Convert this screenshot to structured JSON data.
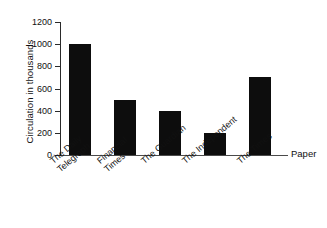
{
  "chart_data": {
    "type": "bar",
    "title": "",
    "subtitle": "",
    "xlabel": "Paper",
    "ylabel": "Circulation in thousands",
    "categories": [
      "The Daily Telegraph",
      "Financial Times",
      "The Guardian",
      "The Independent",
      "The Times"
    ],
    "category_lines": [
      [
        "The Daily",
        "Telegraph"
      ],
      [
        "Financial",
        "Times"
      ],
      [
        "The Guardian"
      ],
      [
        "The Independent"
      ],
      [
        "The Times"
      ]
    ],
    "values": [
      1000,
      500,
      400,
      200,
      700
    ],
    "ylim": [
      0,
      1200
    ],
    "yticks": [
      0,
      200,
      400,
      600,
      800,
      1000,
      1200
    ],
    "ytick_labels": [
      "0",
      "200",
      "400",
      "600",
      "800",
      "1000",
      "1200"
    ],
    "grid": false,
    "legend": false,
    "legend_position": "none",
    "bar_color": "#0d0d0d",
    "background_color": "#ffffff",
    "axis_color": "#2a2a2a"
  },
  "axis": {
    "y_title": "Circulation in thousands",
    "x_title": "Paper",
    "ticks": {
      "t0": "0",
      "t1": "200",
      "t2": "400",
      "t3": "600",
      "t4": "800",
      "t5": "1000",
      "t6": "1200"
    }
  },
  "bars": [
    {
      "label_line1": "The Daily",
      "label_line2": "Telegraph",
      "value": 1000
    },
    {
      "label_line1": "Financial",
      "label_line2": "Times",
      "value": 500
    },
    {
      "label_line1": "The Guardian",
      "label_line2": "",
      "value": 400
    },
    {
      "label_line1": "The Independent",
      "label_line2": "",
      "value": 200
    },
    {
      "label_line1": "The Times",
      "label_line2": "",
      "value": 700
    }
  ]
}
